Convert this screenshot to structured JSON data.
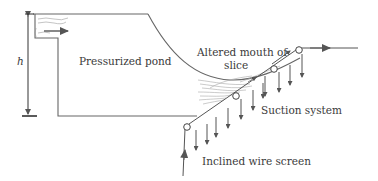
{
  "diagram": {
    "labels": {
      "height_symbol": "h",
      "pond": "Pressurized pond",
      "mouth_line1": "Altered mouth of",
      "mouth_line2": "slice",
      "suction": "Suction system",
      "wire": "Inclined wire screen"
    },
    "colors": {
      "line": "#555555",
      "arrow": "#555555",
      "text": "#3a3a3a",
      "fibers": "#9a9a9a",
      "background": "#ffffff"
    },
    "rollers": [
      {
        "x": 187,
        "y": 127
      },
      {
        "x": 236,
        "y": 96
      },
      {
        "x": 274,
        "y": 69
      },
      {
        "x": 298,
        "y": 50
      }
    ],
    "suction_arrow_count": 11
  }
}
